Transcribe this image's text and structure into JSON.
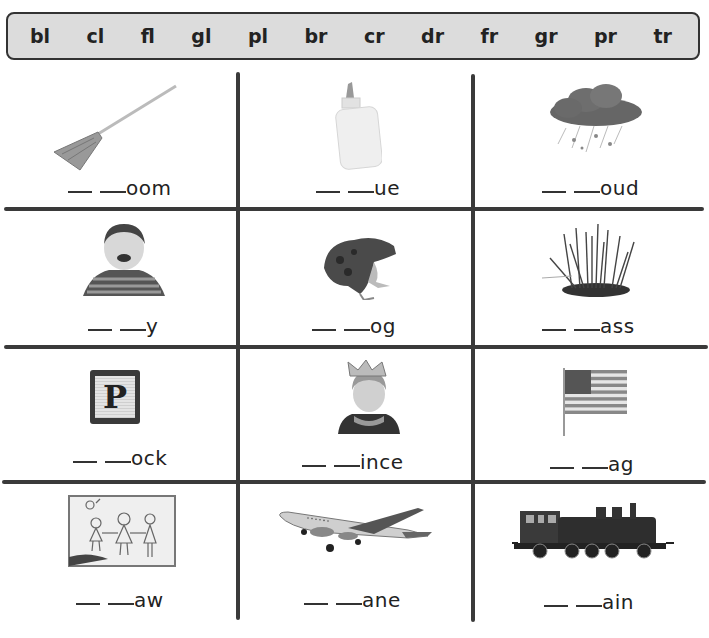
{
  "word_bank": {
    "blends": [
      "bl",
      "cl",
      "fl",
      "gl",
      "pl",
      "br",
      "cr",
      "dr",
      "fr",
      "gr",
      "pr",
      "tr"
    ]
  },
  "grid": {
    "rows": [
      [
        {
          "picture": "broom-icon",
          "ending": "oom"
        },
        {
          "picture": "glue-bottle-icon",
          "ending": "ue"
        },
        {
          "picture": "rain-cloud-icon",
          "ending": "oud"
        }
      ],
      [
        {
          "picture": "crying-child-icon",
          "ending": "y"
        },
        {
          "picture": "frog-icon",
          "ending": "og"
        },
        {
          "picture": "grass-icon",
          "ending": "ass"
        }
      ],
      [
        {
          "picture": "letter-block-icon",
          "ending": "ock",
          "block_letter": "P"
        },
        {
          "picture": "prince-child-icon",
          "ending": "ince"
        },
        {
          "picture": "flag-icon",
          "ending": "ag"
        }
      ],
      [
        {
          "picture": "drawing-icon",
          "ending": "aw"
        },
        {
          "picture": "airplane-icon",
          "ending": "ane"
        },
        {
          "picture": "train-icon",
          "ending": "ain"
        }
      ]
    ]
  },
  "colors": {
    "word_bank_bg": "#dcdcdc",
    "grid_line": "#3a3a3a",
    "text": "#222222"
  }
}
